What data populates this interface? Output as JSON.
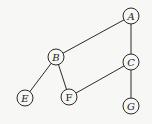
{
  "graph": {
    "nodes": [
      {
        "id": "A",
        "label": "A",
        "italic": true
      },
      {
        "id": "B",
        "label": "B",
        "italic": true
      },
      {
        "id": "C",
        "label": "C",
        "italic": true
      },
      {
        "id": "E",
        "label": "E",
        "italic": true
      },
      {
        "id": "F",
        "label": "F",
        "italic": false
      },
      {
        "id": "G",
        "label": "G",
        "italic": true
      }
    ],
    "edges": [
      [
        "A",
        "B"
      ],
      [
        "A",
        "C"
      ],
      [
        "B",
        "E"
      ],
      [
        "B",
        "F"
      ],
      [
        "C",
        "F"
      ],
      [
        "C",
        "G"
      ]
    ]
  }
}
